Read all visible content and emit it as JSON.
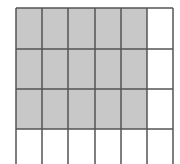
{
  "diagram": {
    "type": "shaded-grid",
    "columns": 6,
    "rows_visible": 4,
    "shaded_columns": 5,
    "shaded_rows": 3,
    "shaded_cells": 15,
    "colors": {
      "shade": "#c8c8c8",
      "line": "#555555",
      "background": "#ffffff"
    },
    "col_x": [
      16,
      42,
      68,
      95,
      121,
      147,
      173
    ],
    "row_y": [
      8,
      49,
      89,
      129
    ],
    "bottom_y": 164
  }
}
